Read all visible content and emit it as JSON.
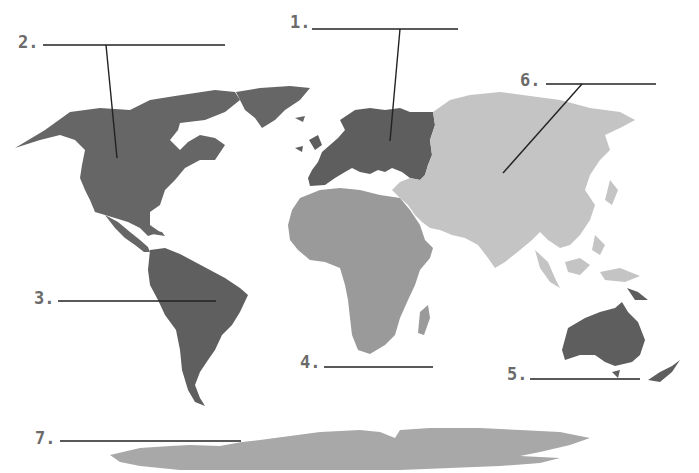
{
  "colors": {
    "dark": "#666666",
    "africa": "#9a9a9a",
    "asia": "#c4c4c4",
    "antarctica": "#a8a8a8",
    "line": "#222222",
    "label": "#6a6a6a",
    "background": "#ffffff"
  },
  "labels": [
    {
      "id": "1",
      "text": "1.",
      "x": 290,
      "y": 12,
      "line_x1": 312,
      "line_x2": 458,
      "line_y": 29,
      "target": "Europe"
    },
    {
      "id": "2",
      "text": "2.",
      "x": 18,
      "y": 32,
      "line_x1": 43,
      "line_x2": 225,
      "line_y": 45,
      "target": "North America"
    },
    {
      "id": "3",
      "text": "3.",
      "x": 34,
      "y": 288,
      "line_x1": 58,
      "line_x2": 216,
      "line_y": 301,
      "target": "South America"
    },
    {
      "id": "4",
      "text": "4.",
      "x": 300,
      "y": 352,
      "line_x1": 324,
      "line_x2": 433,
      "line_y": 367,
      "target": "Africa"
    },
    {
      "id": "5",
      "text": "5.",
      "x": 507,
      "y": 364,
      "line_x1": 530,
      "line_x2": 640,
      "line_y": 379,
      "target": "Australia"
    },
    {
      "id": "6",
      "text": "6.",
      "x": 520,
      "y": 70,
      "line_x1": 546,
      "line_x2": 656,
      "line_y": 84,
      "target": "Asia"
    },
    {
      "id": "7",
      "text": "7.",
      "x": 35,
      "y": 428,
      "line_x1": 60,
      "line_x2": 241,
      "line_y": 441,
      "target": "Antarctica"
    }
  ],
  "pointers": [
    {
      "for": "1",
      "x1": 400,
      "y1": 29,
      "x2": 390,
      "y2": 141
    },
    {
      "for": "2",
      "x1": 106,
      "y1": 45,
      "x2": 117,
      "y2": 158
    },
    {
      "for": "6",
      "x1": 582,
      "y1": 84,
      "x2": 503,
      "y2": 173
    }
  ]
}
